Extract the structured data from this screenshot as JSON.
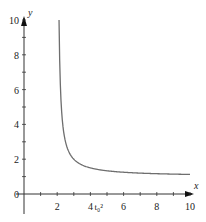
{
  "chart_data": {
    "type": "line",
    "title": "",
    "xlabel": "x",
    "ylabel": "y",
    "xlim": [
      0,
      10
    ],
    "ylim": [
      0,
      10
    ],
    "x_ticks": [
      2,
      4,
      6,
      8,
      10
    ],
    "y_ticks": [
      0,
      2,
      4,
      6,
      8,
      10
    ],
    "grid": false,
    "legend": null,
    "annotations": [
      {
        "text": "t₀²",
        "x": 4.5,
        "y": 0,
        "position": "below-x-axis"
      }
    ],
    "series": [
      {
        "name": "curve",
        "color": "#6e6e6e",
        "description": "Decreasing curve with vertical asymptote near x=2 and horizontal asymptote near y=1 (approx. y = 1 + 1/(x-2))",
        "x": [
          2.11,
          2.2,
          2.3,
          2.5,
          2.75,
          3,
          3.5,
          4,
          4.5,
          5,
          6,
          7,
          8,
          9,
          10
        ],
        "values": [
          10.0,
          6.0,
          4.33,
          3.0,
          2.33,
          2.0,
          1.67,
          1.5,
          1.4,
          1.33,
          1.25,
          1.2,
          1.17,
          1.14,
          1.13
        ]
      }
    ]
  },
  "axes": {
    "x_label": "x",
    "y_label": "y",
    "annotation": "t₀²"
  }
}
